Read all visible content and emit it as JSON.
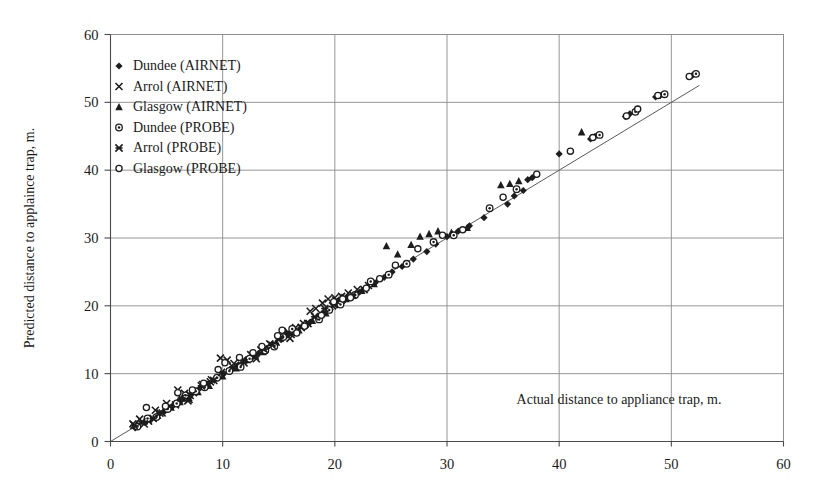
{
  "chart_data": {
    "type": "scatter",
    "title": "",
    "xlabel": "Actual distance to appliance trap, m.",
    "ylabel": "Predicted distance to applaince trap, m.",
    "xlim": [
      0,
      60
    ],
    "ylim": [
      0,
      60
    ],
    "xticks": [
      0,
      10,
      20,
      30,
      40,
      50,
      60
    ],
    "yticks": [
      0,
      10,
      20,
      30,
      40,
      50,
      60
    ],
    "grid": true,
    "legend_position": "upper-left-inside",
    "reference_line": {
      "name": "identity-line",
      "type": "line",
      "from": [
        0,
        0
      ],
      "to": [
        52.5,
        52.5
      ],
      "label": "y = x"
    },
    "series": [
      {
        "name": "Dundee (AIRNET)",
        "marker": "filled-diamond",
        "color": "#1d1d1d",
        "points": [
          [
            2.2,
            2.0
          ],
          [
            3.1,
            2.8
          ],
          [
            3.6,
            3.2
          ],
          [
            4.3,
            4.0
          ],
          [
            4.8,
            4.4
          ],
          [
            5.2,
            5.0
          ],
          [
            5.6,
            5.3
          ],
          [
            6.1,
            6.0
          ],
          [
            6.4,
            6.2
          ],
          [
            6.8,
            6.6
          ],
          [
            7.2,
            7.0
          ],
          [
            8.0,
            7.9
          ],
          [
            8.6,
            8.5
          ],
          [
            9.3,
            9.2
          ],
          [
            10.1,
            10.0
          ],
          [
            10.8,
            10.6
          ],
          [
            11.4,
            11.3
          ],
          [
            12.0,
            11.9
          ],
          [
            12.6,
            12.4
          ],
          [
            13.2,
            13.0
          ],
          [
            13.9,
            13.7
          ],
          [
            14.5,
            14.3
          ],
          [
            15.2,
            15.0
          ],
          [
            15.8,
            15.7
          ],
          [
            16.4,
            16.2
          ],
          [
            17.1,
            17.0
          ],
          [
            17.8,
            17.6
          ],
          [
            18.4,
            18.3
          ],
          [
            19.0,
            19.0
          ],
          [
            19.6,
            19.5
          ],
          [
            20.2,
            20.1
          ],
          [
            20.8,
            20.7
          ],
          [
            21.5,
            21.4
          ],
          [
            22.2,
            22.0
          ],
          [
            22.9,
            22.8
          ],
          [
            23.6,
            23.4
          ],
          [
            24.4,
            24.2
          ],
          [
            25.1,
            25.0
          ],
          [
            26.0,
            25.8
          ],
          [
            27.0,
            26.9
          ],
          [
            28.2,
            28.0
          ],
          [
            29.0,
            29.1
          ],
          [
            30.0,
            30.2
          ],
          [
            31.0,
            31.0
          ],
          [
            32.0,
            31.8
          ],
          [
            33.3,
            33.0
          ],
          [
            35.4,
            35.0
          ],
          [
            36.0,
            36.2
          ],
          [
            36.8,
            37.0
          ],
          [
            37.2,
            38.6
          ],
          [
            37.6,
            38.9
          ],
          [
            40.0,
            42.4
          ],
          [
            42.8,
            44.6
          ],
          [
            43.2,
            45.0
          ],
          [
            45.9,
            47.9
          ],
          [
            46.3,
            48.3
          ],
          [
            48.6,
            50.8
          ],
          [
            49.0,
            51.0
          ],
          [
            51.9,
            54.0
          ]
        ]
      },
      {
        "name": "Arrol (AIRNET)",
        "marker": "cross-x",
        "color": "#1d1d1d",
        "points": [
          [
            2.0,
            2.6
          ],
          [
            2.6,
            3.3
          ],
          [
            3.4,
            3.0
          ],
          [
            4.0,
            4.6
          ],
          [
            4.6,
            4.2
          ],
          [
            5.0,
            5.6
          ],
          [
            5.8,
            5.4
          ],
          [
            6.6,
            7.1
          ],
          [
            7.4,
            7.2
          ],
          [
            8.2,
            8.4
          ],
          [
            9.0,
            9.1
          ],
          [
            9.8,
            12.3
          ],
          [
            10.4,
            12.0
          ],
          [
            11.0,
            11.5
          ],
          [
            11.8,
            12.0
          ],
          [
            12.5,
            12.8
          ],
          [
            13.4,
            13.5
          ],
          [
            14.2,
            14.4
          ],
          [
            15.0,
            15.3
          ],
          [
            15.9,
            16.0
          ],
          [
            16.5,
            16.8
          ],
          [
            17.2,
            17.4
          ],
          [
            17.8,
            19.2
          ],
          [
            18.3,
            19.6
          ],
          [
            18.9,
            20.4
          ],
          [
            19.4,
            21.0
          ],
          [
            20.0,
            21.2
          ],
          [
            20.6,
            21.4
          ],
          [
            21.2,
            21.9
          ],
          [
            22.0,
            22.4
          ],
          [
            23.0,
            23.0
          ],
          [
            6.0,
            7.6
          ],
          [
            7.0,
            6.2
          ],
          [
            13.0,
            12.2
          ],
          [
            16.0,
            15.2
          ],
          [
            19.8,
            20.0
          ]
        ]
      },
      {
        "name": "Glasgow (AIRNET)",
        "marker": "filled-triangle",
        "color": "#1d1d1d",
        "points": [
          [
            4.2,
            3.8
          ],
          [
            5.4,
            5.0
          ],
          [
            6.2,
            5.8
          ],
          [
            7.0,
            6.4
          ],
          [
            7.8,
            7.3
          ],
          [
            8.8,
            8.2
          ],
          [
            10.0,
            9.6
          ],
          [
            11.2,
            10.8
          ],
          [
            12.2,
            12.0
          ],
          [
            12.8,
            12.6
          ],
          [
            13.6,
            13.2
          ],
          [
            14.8,
            14.6
          ],
          [
            15.6,
            16.2
          ],
          [
            16.8,
            16.4
          ],
          [
            18.0,
            17.8
          ],
          [
            19.2,
            18.9
          ],
          [
            20.4,
            20.6
          ],
          [
            21.0,
            21.0
          ],
          [
            22.4,
            22.2
          ],
          [
            23.5,
            23.2
          ],
          [
            24.6,
            28.8
          ],
          [
            25.6,
            27.6
          ],
          [
            26.8,
            29.0
          ],
          [
            27.6,
            30.2
          ],
          [
            28.4,
            30.6
          ],
          [
            29.2,
            31.0
          ],
          [
            30.4,
            30.8
          ],
          [
            31.8,
            31.5
          ],
          [
            34.8,
            37.8
          ],
          [
            35.6,
            38.0
          ],
          [
            36.4,
            38.4
          ],
          [
            42.0,
            45.6
          ]
        ]
      },
      {
        "name": "Dundee (PROBE)",
        "marker": "circle-dot",
        "color": "#1d1d1d",
        "points": [
          [
            2.4,
            2.2
          ],
          [
            3.3,
            3.4
          ],
          [
            4.1,
            3.6
          ],
          [
            5.1,
            4.8
          ],
          [
            5.9,
            5.6
          ],
          [
            6.7,
            6.8
          ],
          [
            7.6,
            7.4
          ],
          [
            8.4,
            8.0
          ],
          [
            9.5,
            9.4
          ],
          [
            10.6,
            10.4
          ],
          [
            11.6,
            11.0
          ],
          [
            12.4,
            12.2
          ],
          [
            13.8,
            13.4
          ],
          [
            14.6,
            14.0
          ],
          [
            15.4,
            15.4
          ],
          [
            16.2,
            16.6
          ],
          [
            17.4,
            17.2
          ],
          [
            18.6,
            18.0
          ],
          [
            19.5,
            19.4
          ],
          [
            20.5,
            20.2
          ],
          [
            21.8,
            21.6
          ],
          [
            23.2,
            23.6
          ],
          [
            24.8,
            24.6
          ],
          [
            26.4,
            26.2
          ],
          [
            28.8,
            29.4
          ],
          [
            30.6,
            30.4
          ],
          [
            33.8,
            34.4
          ],
          [
            36.2,
            37.2
          ],
          [
            43.6,
            45.2
          ],
          [
            46.8,
            48.6
          ],
          [
            49.4,
            51.2
          ],
          [
            52.2,
            54.2
          ]
        ]
      },
      {
        "name": "Arrol (PROBE)",
        "marker": "asterisk",
        "color": "#1d1d1d",
        "points": [
          [
            2.1,
            2.4
          ],
          [
            2.8,
            2.9
          ],
          [
            3.8,
            3.4
          ],
          [
            4.4,
            4.2
          ],
          [
            5.3,
            5.2
          ],
          [
            6.3,
            6.4
          ],
          [
            7.1,
            6.8
          ],
          [
            8.1,
            8.2
          ],
          [
            8.9,
            8.8
          ],
          [
            9.9,
            10.2
          ],
          [
            10.9,
            11.0
          ],
          [
            11.9,
            11.6
          ],
          [
            12.9,
            12.6
          ],
          [
            13.7,
            13.6
          ],
          [
            14.4,
            14.2
          ],
          [
            15.1,
            15.2
          ],
          [
            16.1,
            15.8
          ],
          [
            17.0,
            16.8
          ],
          [
            17.6,
            17.4
          ],
          [
            18.2,
            18.4
          ],
          [
            19.1,
            19.6
          ],
          [
            20.1,
            20.8
          ],
          [
            20.9,
            21.2
          ],
          [
            21.6,
            21.6
          ],
          [
            22.6,
            22.4
          ],
          [
            3.0,
            2.6
          ],
          [
            6.9,
            6.0
          ],
          [
            9.2,
            9.0
          ]
        ]
      },
      {
        "name": "Glasgow (PROBE)",
        "marker": "open-circle",
        "color": "#1d1d1d",
        "points": [
          [
            3.2,
            5.0
          ],
          [
            4.9,
            5.2
          ],
          [
            6.0,
            7.2
          ],
          [
            7.3,
            7.6
          ],
          [
            8.3,
            8.6
          ],
          [
            9.6,
            10.6
          ],
          [
            10.2,
            11.6
          ],
          [
            11.5,
            12.4
          ],
          [
            12.7,
            13.1
          ],
          [
            13.5,
            14.0
          ],
          [
            14.9,
            15.6
          ],
          [
            15.3,
            16.4
          ],
          [
            16.6,
            16.0
          ],
          [
            17.3,
            17.0
          ],
          [
            18.8,
            18.6
          ],
          [
            19.9,
            20.6
          ],
          [
            20.7,
            21.0
          ],
          [
            21.4,
            21.2
          ],
          [
            22.8,
            22.6
          ],
          [
            24.0,
            24.0
          ],
          [
            25.4,
            26.0
          ],
          [
            27.4,
            28.4
          ],
          [
            29.6,
            30.4
          ],
          [
            31.4,
            31.2
          ],
          [
            35.0,
            36.0
          ],
          [
            38.0,
            39.4
          ],
          [
            41.0,
            42.8
          ],
          [
            43.0,
            44.8
          ],
          [
            46.0,
            48.0
          ],
          [
            47.0,
            49.0
          ],
          [
            48.8,
            51.0
          ],
          [
            51.6,
            53.8
          ]
        ]
      }
    ]
  },
  "legend": {
    "items": [
      {
        "label": "Dundee (AIRNET)",
        "marker": "filled-diamond"
      },
      {
        "label": "Arrol (AIRNET)",
        "marker": "cross-x"
      },
      {
        "label": "Glasgow (AIRNET)",
        "marker": "filled-triangle"
      },
      {
        "label": "Dundee (PROBE)",
        "marker": "circle-dot"
      },
      {
        "label": "Arrol (PROBE)",
        "marker": "asterisk"
      },
      {
        "label": "Glasgow (PROBE)",
        "marker": "open-circle"
      }
    ]
  },
  "axes": {
    "x_title": "Actual distance to appliance trap, m.",
    "y_title": "Predicted distance to applaince trap, m.",
    "x_tick_labels": [
      "0",
      "10",
      "20",
      "30",
      "40",
      "50",
      "60"
    ],
    "y_tick_labels": [
      "0",
      "10",
      "20",
      "30",
      "40",
      "50",
      "60"
    ]
  }
}
